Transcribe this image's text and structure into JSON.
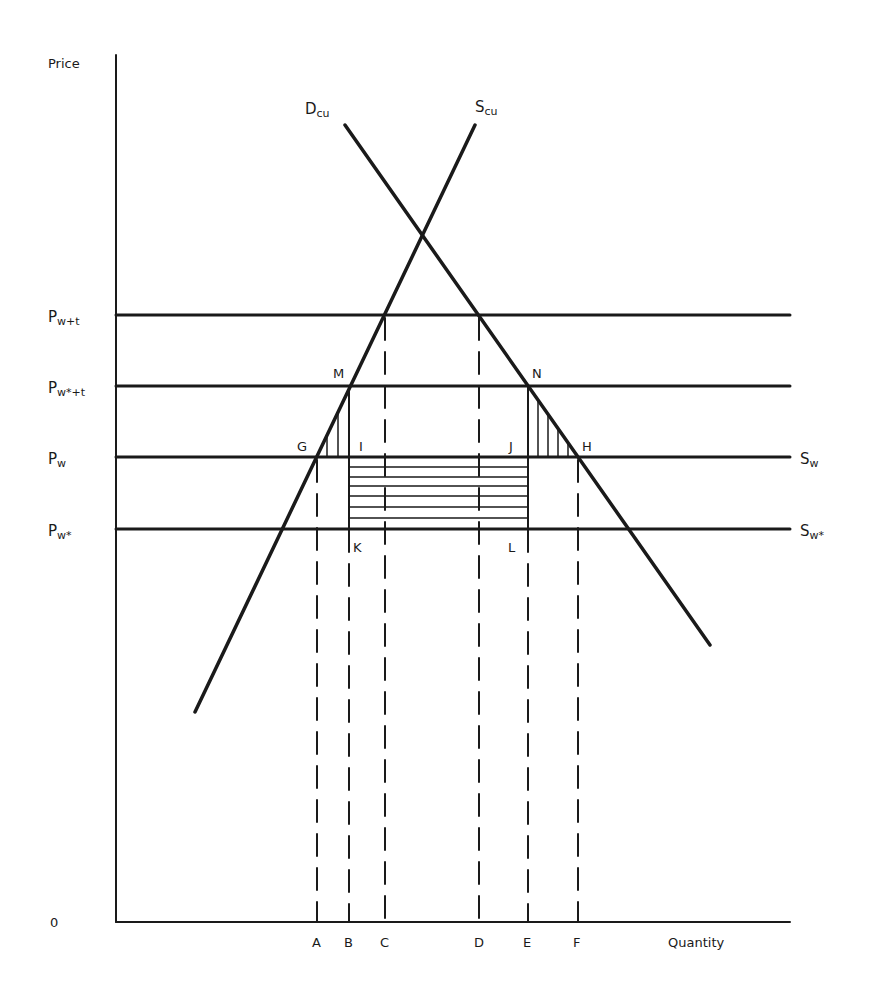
{
  "diagram": {
    "axes": {
      "y_label": "Price",
      "x_label": "Quantity",
      "origin_label": "0"
    },
    "curves": {
      "demand": {
        "main": "D",
        "sub": "cu"
      },
      "supply": {
        "main": "S",
        "sub": "cu"
      }
    },
    "price_levels": [
      {
        "main": "P",
        "sub": "w+t",
        "y": 315
      },
      {
        "main": "P",
        "sub": "w*+t",
        "y": 386
      },
      {
        "main": "P",
        "sub": "w",
        "y": 457
      },
      {
        "main": "P",
        "sub": "w*",
        "y": 529
      }
    ],
    "world_supply": [
      {
        "main": "S",
        "sub": "w"
      },
      {
        "main": "S",
        "sub": "w*"
      }
    ],
    "quantity_ticks": [
      {
        "label": "A",
        "x": 317
      },
      {
        "label": "B",
        "x": 349
      },
      {
        "label": "C",
        "x": 385
      },
      {
        "label": "D",
        "x": 479
      },
      {
        "label": "E",
        "x": 528
      },
      {
        "label": "F",
        "x": 578
      }
    ],
    "points": {
      "G": "G",
      "I": "I",
      "J": "J",
      "H": "H",
      "M": "M",
      "N": "N",
      "K": "K",
      "L": "L"
    },
    "colors": {
      "ink": "#1a1a1a",
      "background": "#ffffff"
    }
  }
}
